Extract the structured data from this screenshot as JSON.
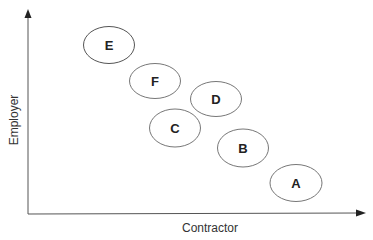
{
  "diagram": {
    "x_axis_label": "Contractor",
    "y_axis_label": "Employer",
    "nodes": [
      {
        "label": "E",
        "cx": 109,
        "cy": 45
      },
      {
        "label": "F",
        "cx": 155,
        "cy": 81
      },
      {
        "label": "D",
        "cx": 216,
        "cy": 99
      },
      {
        "label": "C",
        "cx": 175,
        "cy": 128
      },
      {
        "label": "B",
        "cx": 243,
        "cy": 148
      },
      {
        "label": "A",
        "cx": 296,
        "cy": 183
      }
    ],
    "colors": {
      "stroke": "#555555",
      "text": "#222222",
      "axis": "#444444"
    }
  }
}
